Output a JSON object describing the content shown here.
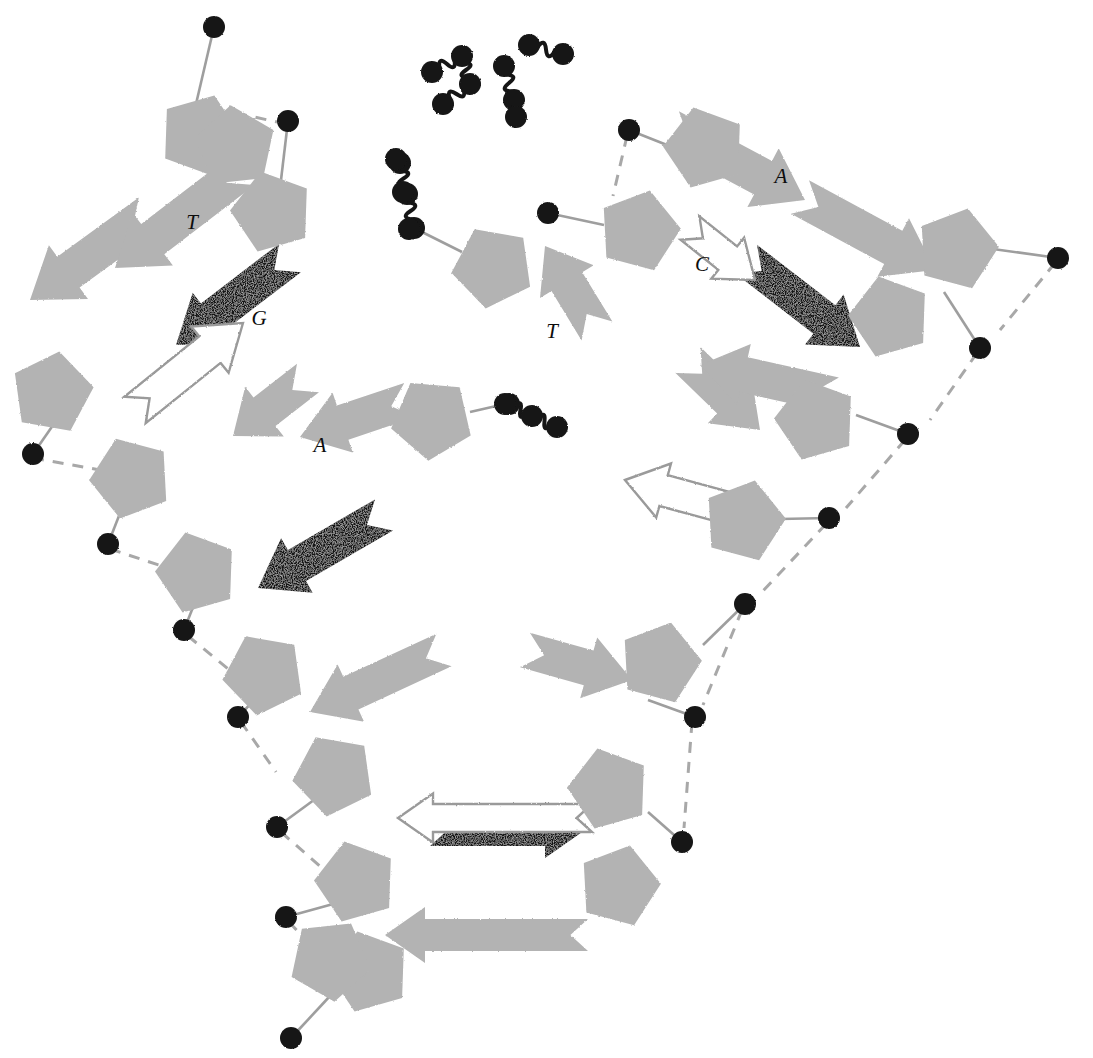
{
  "figure": {
    "domain": "Diagram",
    "background_color": "#ffffff",
    "legend_note_not_shown": ""
  },
  "palette": {
    "sugar_gray": "#b3b3b3",
    "base_gray": "#b3b3b3",
    "base_black": "#141414",
    "base_outline_stroke": "#9a9a9a",
    "phosphate_black": "#151515",
    "bond_line": "#9e9e9e",
    "hbond_dash": "#a8a8a8",
    "label_color": "#0d0d0d"
  },
  "base_labels": [
    {
      "id": "label-T-upper-left",
      "text": "T",
      "x": 192,
      "y": 229
    },
    {
      "id": "label-G-upper-left",
      "text": "G",
      "x": 259,
      "y": 325
    },
    {
      "id": "label-A-mid-left",
      "text": "A",
      "x": 320,
      "y": 452
    },
    {
      "id": "label-T-center",
      "text": "T",
      "x": 552,
      "y": 338
    },
    {
      "id": "label-C-right",
      "text": "C",
      "x": 702,
      "y": 271
    },
    {
      "id": "label-A-upper-right",
      "text": "A",
      "x": 781,
      "y": 183
    }
  ],
  "glyph_counts": {
    "sugar_pentagons": 22,
    "phosphate_circles": 22,
    "gray_base_arrows": 12,
    "black_base_arrows": 4,
    "outlined_base_arrows": 4,
    "free_squiggle_chains": 5
  },
  "sugars": [
    {
      "id": "sugar-1",
      "cx": 200,
      "cy": 135,
      "r": 42,
      "rot": 20
    },
    {
      "id": "sugar-2",
      "cx": 272,
      "cy": 212,
      "r": 42,
      "rot": 200
    },
    {
      "id": "sugar-3",
      "cx": 52,
      "cy": 393,
      "r": 42,
      "rot": 10
    },
    {
      "id": "sugar-4",
      "cx": 131,
      "cy": 478,
      "r": 42,
      "rot": 195
    },
    {
      "id": "sugar-5",
      "cx": 197,
      "cy": 573,
      "r": 42,
      "rot": 200
    },
    {
      "id": "sugar-6",
      "cx": 264,
      "cy": 674,
      "r": 42,
      "rot": 190
    },
    {
      "id": "sugar-7",
      "cx": 334,
      "cy": 775,
      "r": 42,
      "rot": 190
    },
    {
      "id": "sugar-8",
      "cx": 356,
      "cy": 882,
      "r": 42,
      "rot": 200
    },
    {
      "id": "sugar-9",
      "cx": 369,
      "cy": 972,
      "r": 42,
      "rot": 200
    },
    {
      "id": "sugar-10",
      "cx": 493,
      "cy": 267,
      "r": 42,
      "rot": 190
    },
    {
      "id": "sugar-11",
      "cx": 432,
      "cy": 419,
      "r": 42,
      "rot": 185
    },
    {
      "id": "sugar-12",
      "cx": 639,
      "cy": 231,
      "r": 42,
      "rot": 15
    },
    {
      "id": "sugar-13",
      "cx": 705,
      "cy": 148,
      "r": 42,
      "rot": 200
    },
    {
      "id": "sugar-14",
      "cx": 890,
      "cy": 317,
      "r": 42,
      "rot": 200
    },
    {
      "id": "sugar-15",
      "cx": 957,
      "cy": 249,
      "r": 42,
      "rot": 15
    },
    {
      "id": "sugar-16",
      "cx": 816,
      "cy": 420,
      "r": 42,
      "rot": 200
    },
    {
      "id": "sugar-17",
      "cx": 744,
      "cy": 521,
      "r": 42,
      "rot": 15
    },
    {
      "id": "sugar-18",
      "cx": 660,
      "cy": 663,
      "r": 42,
      "rot": 15
    },
    {
      "id": "sugar-19",
      "cx": 609,
      "cy": 789,
      "r": 42,
      "rot": 200
    },
    {
      "id": "sugar-20",
      "cx": 619,
      "cy": 886,
      "r": 42,
      "rot": 15
    },
    {
      "id": "sugar-21",
      "cx": 235,
      "cy": 147,
      "r": 42,
      "rot": 210
    },
    {
      "id": "sugar-22",
      "cx": 330,
      "cy": 960,
      "r": 42,
      "rot": 30
    }
  ],
  "phosphates": [
    {
      "id": "p-1",
      "cx": 214,
      "cy": 27,
      "r": 11
    },
    {
      "id": "p-2",
      "cx": 288,
      "cy": 121,
      "r": 11
    },
    {
      "id": "p-3",
      "cx": 33,
      "cy": 454,
      "r": 11
    },
    {
      "id": "p-4",
      "cx": 108,
      "cy": 544,
      "r": 11
    },
    {
      "id": "p-5",
      "cx": 184,
      "cy": 630,
      "r": 11
    },
    {
      "id": "p-6",
      "cx": 238,
      "cy": 717,
      "r": 11
    },
    {
      "id": "p-7",
      "cx": 277,
      "cy": 827,
      "r": 11
    },
    {
      "id": "p-8",
      "cx": 286,
      "cy": 917,
      "r": 11
    },
    {
      "id": "p-9",
      "cx": 291,
      "cy": 1038,
      "r": 11
    },
    {
      "id": "p-10",
      "cx": 548,
      "cy": 213,
      "r": 11
    },
    {
      "id": "p-11",
      "cx": 629,
      "cy": 130,
      "r": 11
    },
    {
      "id": "p-12",
      "cx": 1058,
      "cy": 258,
      "r": 11
    },
    {
      "id": "p-13",
      "cx": 980,
      "cy": 348,
      "r": 11
    },
    {
      "id": "p-14",
      "cx": 908,
      "cy": 434,
      "r": 11
    },
    {
      "id": "p-15",
      "cx": 829,
      "cy": 518,
      "r": 11
    },
    {
      "id": "p-16",
      "cx": 745,
      "cy": 604,
      "r": 11
    },
    {
      "id": "p-17",
      "cx": 695,
      "cy": 717,
      "r": 11
    },
    {
      "id": "p-18",
      "cx": 682,
      "cy": 842,
      "r": 11
    },
    {
      "id": "p-19",
      "cx": 396,
      "cy": 159,
      "r": 11
    },
    {
      "id": "p-20",
      "cx": 409,
      "cy": 229,
      "r": 11
    },
    {
      "id": "p-21",
      "cx": 403,
      "cy": 192,
      "r": 11
    },
    {
      "id": "p-22",
      "cx": 505,
      "cy": 404,
      "r": 11
    }
  ],
  "squiggle_chains": [
    {
      "id": "chain-top-left",
      "balls": [
        [
          432,
          72
        ],
        [
          462,
          56
        ],
        [
          470,
          84
        ],
        [
          443,
          104
        ]
      ],
      "segments": 3
    },
    {
      "id": "chain-top-mid",
      "balls": [
        [
          504,
          66
        ],
        [
          514,
          100
        ],
        [
          516,
          117
        ]
      ],
      "segments": 2
    },
    {
      "id": "chain-top-right",
      "balls": [
        [
          529,
          45
        ],
        [
          563,
          54
        ]
      ],
      "segments": 1
    },
    {
      "id": "chain-left-arm",
      "balls": [
        [
          400,
          163
        ],
        [
          407,
          194
        ],
        [
          414,
          228
        ]
      ],
      "segments": 2
    },
    {
      "id": "chain-center",
      "balls": [
        [
          509,
          404
        ],
        [
          532,
          416
        ],
        [
          557,
          427
        ]
      ],
      "segments": 2
    }
  ],
  "base_arrows": [
    {
      "id": "arrow-gray-1",
      "fill": "gray",
      "x1": 150,
      "y1": 213,
      "x2": 30,
      "y2": 300,
      "w": 38
    },
    {
      "id": "arrow-gray-2",
      "fill": "gray",
      "x1": 243,
      "y1": 170,
      "x2": 115,
      "y2": 268,
      "w": 38
    },
    {
      "id": "arrow-black-1",
      "fill": "black",
      "x1": 290,
      "y1": 258,
      "x2": 176,
      "y2": 345,
      "w": 36
    },
    {
      "id": "arrow-outline-1",
      "fill": "outline",
      "x1": 135,
      "y1": 410,
      "x2": 243,
      "y2": 323,
      "w": 34
    },
    {
      "id": "arrow-gray-3",
      "fill": "gray",
      "x1": 308,
      "y1": 378,
      "x2": 233,
      "y2": 436,
      "w": 36
    },
    {
      "id": "arrow-gray-4",
      "fill": "gray",
      "x1": 410,
      "y1": 400,
      "x2": 300,
      "y2": 437,
      "w": 36
    },
    {
      "id": "arrow-black-2",
      "fill": "black",
      "x1": 384,
      "y1": 515,
      "x2": 258,
      "y2": 588,
      "w": 36
    },
    {
      "id": "arrow-gray-5",
      "fill": "gray",
      "x1": 444,
      "y1": 650,
      "x2": 310,
      "y2": 712,
      "w": 36
    },
    {
      "id": "arrow-gray-6",
      "fill": "gray",
      "x1": 597,
      "y1": 331,
      "x2": 545,
      "y2": 246,
      "w": 36
    },
    {
      "id": "arrow-gray-7",
      "fill": "gray",
      "x1": 525,
      "y1": 650,
      "x2": 632,
      "y2": 680,
      "w": 36
    },
    {
      "id": "arrow-black-3",
      "fill": "black",
      "x1": 430,
      "y1": 830,
      "x2": 585,
      "y2": 830,
      "w": 32
    },
    {
      "id": "arrow-outline-2",
      "fill": "outline",
      "x1": 592,
      "y1": 818,
      "x2": 398,
      "y2": 818,
      "w": 28
    },
    {
      "id": "arrow-gray-8",
      "fill": "gray",
      "x1": 588,
      "y1": 935,
      "x2": 385,
      "y2": 935,
      "w": 32
    },
    {
      "id": "arrow-gray-9",
      "fill": "gray",
      "x1": 688,
      "y1": 360,
      "x2": 760,
      "y2": 430,
      "w": 36
    },
    {
      "id": "arrow-gray-10",
      "fill": "gray",
      "x1": 670,
      "y1": 128,
      "x2": 805,
      "y2": 200,
      "w": 38
    },
    {
      "id": "arrow-gray-11",
      "fill": "gray",
      "x1": 800,
      "y1": 197,
      "x2": 935,
      "y2": 270,
      "w": 38
    },
    {
      "id": "arrow-black-4",
      "fill": "black",
      "x1": 746,
      "y1": 259,
      "x2": 860,
      "y2": 347,
      "w": 36
    },
    {
      "id": "arrow-outline-3",
      "fill": "outline",
      "x1": 690,
      "y1": 228,
      "x2": 755,
      "y2": 280,
      "w": 30
    },
    {
      "id": "arrow-outline-4",
      "fill": "outline",
      "x1": 735,
      "y1": 510,
      "x2": 625,
      "y2": 480,
      "w": 32
    },
    {
      "id": "arrow-gray-12",
      "fill": "gray",
      "x1": 835,
      "y1": 395,
      "x2": 700,
      "y2": 365,
      "w": 36
    }
  ]
}
